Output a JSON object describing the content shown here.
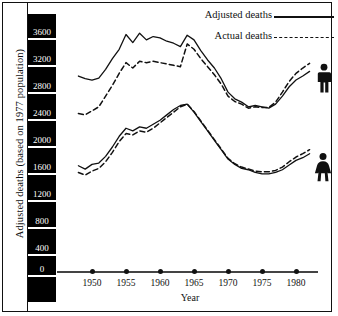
{
  "chart_data": {
    "type": "line",
    "title": "",
    "xlabel": "Year",
    "ylabel": "Adjusted deaths (based on 1977 population)",
    "xlim": [
      1948,
      1982
    ],
    "ylim": [
      0,
      3700
    ],
    "grid": false,
    "legend_position": "top-right",
    "x_ticks": [
      1950,
      1955,
      1960,
      1965,
      1970,
      1975,
      1980
    ],
    "y_ticks": [
      0,
      400,
      800,
      1200,
      1600,
      2000,
      2400,
      2800,
      3200,
      3600
    ],
    "legend": [
      {
        "name": "Adjusted deaths",
        "style": "solid"
      },
      {
        "name": "Actual deaths",
        "style": "dashed"
      }
    ],
    "group_labels": [
      {
        "name": "male",
        "icon": "male-figure-icon"
      },
      {
        "name": "female",
        "icon": "female-figure-icon"
      }
    ],
    "x": [
      1948,
      1949,
      1950,
      1951,
      1952,
      1953,
      1954,
      1955,
      1956,
      1957,
      1958,
      1959,
      1960,
      1961,
      1962,
      1963,
      1964,
      1965,
      1966,
      1967,
      1968,
      1969,
      1970,
      1971,
      1972,
      1973,
      1974,
      1975,
      1976,
      1977,
      1978,
      1979,
      1980,
      1981,
      1982
    ],
    "series": [
      {
        "name": "Male adjusted deaths",
        "group": "male",
        "style": "solid",
        "values": [
          2860,
          2820,
          2800,
          2830,
          2960,
          3120,
          3260,
          3480,
          3360,
          3500,
          3400,
          3450,
          3430,
          3380,
          3350,
          3300,
          3470,
          3400,
          3240,
          3100,
          2980,
          2820,
          2620,
          2520,
          2470,
          2400,
          2420,
          2400,
          2380,
          2440,
          2560,
          2700,
          2800,
          2860,
          2930
        ]
      },
      {
        "name": "Male actual deaths",
        "group": "male",
        "style": "dashed",
        "values": [
          2300,
          2280,
          2340,
          2400,
          2560,
          2720,
          2900,
          3060,
          2980,
          3080,
          3060,
          3080,
          3060,
          3040,
          3020,
          3000,
          3340,
          3260,
          3120,
          3000,
          2880,
          2740,
          2560,
          2480,
          2440,
          2380,
          2400,
          2390,
          2390,
          2470,
          2620,
          2780,
          2900,
          2980,
          3050
        ]
      },
      {
        "name": "Female adjusted deaths",
        "group": "female",
        "style": "solid",
        "values": [
          1520,
          1470,
          1540,
          1560,
          1660,
          1800,
          1960,
          2080,
          2040,
          2100,
          2080,
          2140,
          2200,
          2280,
          2360,
          2420,
          2440,
          2320,
          2180,
          2040,
          1900,
          1760,
          1620,
          1540,
          1480,
          1460,
          1420,
          1400,
          1400,
          1420,
          1460,
          1530,
          1600,
          1640,
          1700
        ]
      },
      {
        "name": "Female actual deaths",
        "group": "female",
        "style": "dashed",
        "values": [
          1420,
          1380,
          1440,
          1480,
          1580,
          1720,
          1880,
          2000,
          1980,
          2040,
          2020,
          2080,
          2160,
          2240,
          2320,
          2400,
          2440,
          2330,
          2190,
          2050,
          1910,
          1770,
          1630,
          1550,
          1500,
          1470,
          1440,
          1430,
          1430,
          1450,
          1500,
          1580,
          1650,
          1700,
          1760
        ]
      }
    ]
  },
  "axis": {
    "y_title": "Adjusted deaths (based on 1977 population)",
    "x_title": "Year",
    "y_labels": [
      "3600",
      "3200",
      "2800",
      "2400",
      "2000",
      "1600",
      "1200",
      "800",
      "400",
      "0"
    ],
    "x_labels": [
      "1950",
      "1955",
      "1960",
      "1965",
      "1970",
      "1975",
      "1980"
    ]
  },
  "legend": {
    "adjusted_label": "Adjusted deaths",
    "actual_label": "Actual deaths"
  },
  "colors": {
    "ink": "#111111",
    "label_block": "#000000",
    "label_text": "#ffffff",
    "background": "#ffffff"
  }
}
